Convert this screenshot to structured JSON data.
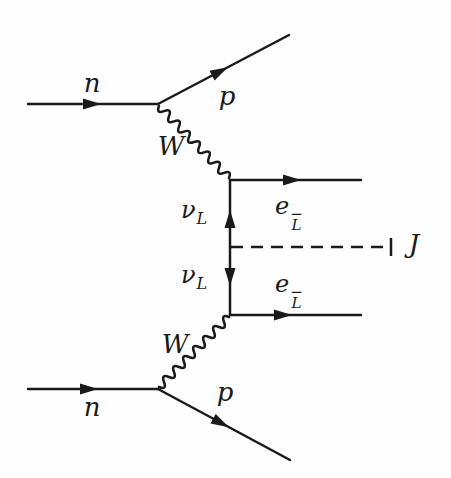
{
  "diagram": {
    "colors": {
      "ink": "#1a1a1a",
      "background": "#fefefe"
    },
    "labels": {
      "n_top": "n",
      "n_bottom": "n",
      "p_top": "p",
      "p_bottom": "p",
      "W_top": "W",
      "W_bottom": "W",
      "nu_top": {
        "base": "ν",
        "sub": "L"
      },
      "nu_bottom": {
        "base": "ν",
        "sub": "L"
      },
      "e_top": {
        "base": "e",
        "sub": "L",
        "sup": "−"
      },
      "e_bottom": {
        "base": "e",
        "sub": "L",
        "sup": "−"
      },
      "J": "J"
    }
  }
}
